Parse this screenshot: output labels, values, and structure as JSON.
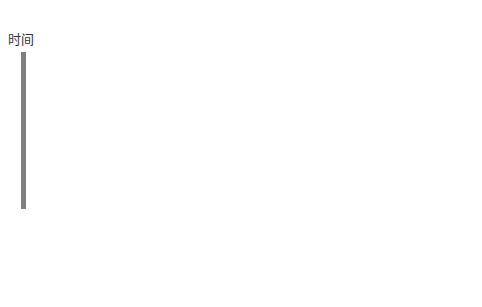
{
  "figure": {
    "time_label": "时间",
    "panels": [
      {
        "id": "A",
        "label": "A",
        "x": 102
      },
      {
        "id": "B",
        "label": "B",
        "x": 239
      },
      {
        "id": "C",
        "label": "C",
        "x": 407
      }
    ],
    "species": [
      {
        "id": "S1",
        "main": "S",
        "sub": "1",
        "fill": "#000000",
        "stroke": "#000000"
      },
      {
        "id": "S2",
        "main": "S",
        "sub": "2",
        "fill": "#1a1a1a",
        "stroke": "#1a1a1a"
      },
      {
        "id": "S3",
        "main": "S",
        "sub": "3",
        "fill": "#a8a8a8",
        "stroke": "#a8a8a8"
      },
      {
        "id": "S4",
        "main": "S",
        "sub": "4",
        "fill": "#ffffff",
        "stroke": "#222222"
      }
    ],
    "colors": {
      "time_bar": "#7f7f7f",
      "frame": "#cfcfcf",
      "line": "#111111"
    }
  }
}
